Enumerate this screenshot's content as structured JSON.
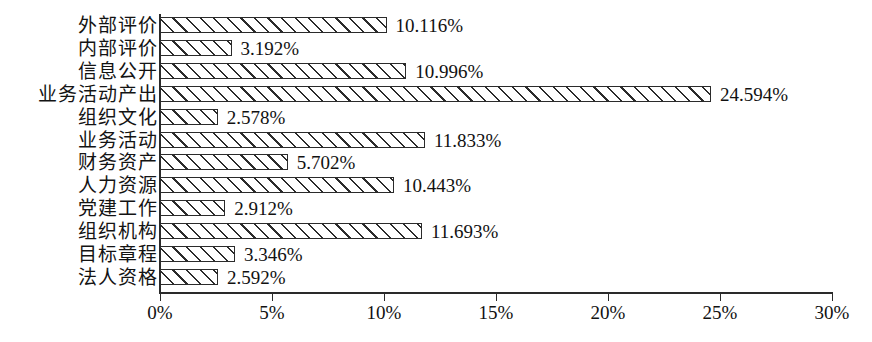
{
  "chart_data": {
    "type": "bar",
    "orientation": "horizontal",
    "title": "",
    "subtitle": "",
    "xlabel": "",
    "ylabel": "",
    "xlim": [
      0,
      30
    ],
    "xunit": "%",
    "grid": false,
    "legend": null,
    "axis": {
      "x_ticks": [
        0,
        5,
        10,
        15,
        20,
        25,
        30
      ],
      "x_tick_labels": [
        "0%",
        "5%",
        "10%",
        "15%",
        "20%",
        "25%",
        "30%"
      ]
    },
    "style": {
      "bar_fill": "#ffffff",
      "bar_edge": "#2b2b2b",
      "hatch": "/",
      "background": "#ffffff",
      "text": "#111111"
    },
    "categories": [
      "外部评价",
      "内部评价",
      "信息公开",
      "业务活动产出",
      "组织文化",
      "业务活动",
      "财务资产",
      "人力资源",
      "党建工作",
      "组织机构",
      "目标章程",
      "法人资格"
    ],
    "values": [
      10.116,
      3.192,
      10.996,
      24.594,
      2.578,
      11.833,
      5.702,
      10.443,
      2.912,
      11.693,
      3.346,
      2.592
    ],
    "value_labels": [
      "10.116%",
      "3.192%",
      "10.996%",
      "24.594%",
      "2.578%",
      "11.833%",
      "5.702%",
      "10.443%",
      "2.912%",
      "11.693%",
      "3.346%",
      "2.592%"
    ]
  }
}
